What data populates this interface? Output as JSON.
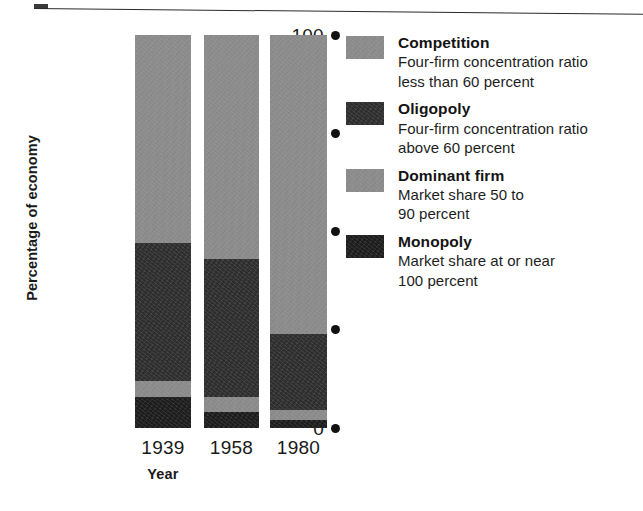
{
  "chart_data": {
    "type": "bar",
    "subtype": "stacked-bar-100",
    "title": "",
    "xlabel": "Year",
    "ylabel": "Percentage of economy",
    "categories": [
      "1939",
      "1958",
      "1980"
    ],
    "ylim": [
      0,
      100
    ],
    "yticks": [
      "0",
      "25",
      "50",
      "75",
      "100"
    ],
    "ytick_values": [
      0,
      25,
      50,
      75,
      100
    ],
    "grid": false,
    "legend_position": "right",
    "stack_order_bottom_to_top": [
      "Monopoly",
      "Dominant firm",
      "Oligopoly",
      "Competition"
    ],
    "series": [
      {
        "name": "Competition",
        "color": "#8c8c8c",
        "values": [
          53,
          57,
          76
        ]
      },
      {
        "name": "Oligopoly",
        "color": "#2d2d2d",
        "values": [
          35,
          35,
          19.5
        ]
      },
      {
        "name": "Dominant firm",
        "color": "#8c8c8c",
        "values": [
          4,
          4,
          2.5
        ]
      },
      {
        "name": "Monopoly",
        "color": "#1c1c1c",
        "values": [
          8,
          4,
          2
        ]
      }
    ],
    "cumulative_tops": {
      "1939": {
        "Monopoly": 8,
        "Dominant firm": 12,
        "Oligopoly": 47,
        "Competition": 100
      },
      "1958": {
        "Monopoly": 4,
        "Dominant firm": 8,
        "Oligopoly": 43,
        "Competition": 100
      },
      "1980": {
        "Monopoly": 2,
        "Dominant firm": 4.5,
        "Oligopoly": 24,
        "Competition": 100
      }
    }
  },
  "axes": {
    "y_title": "Percentage of economy",
    "x_title": "Year",
    "y_ticks": [
      {
        "label": "100",
        "value": 100
      },
      {
        "label": "75",
        "value": 75
      },
      {
        "label": "50",
        "value": 50
      },
      {
        "label": "25",
        "value": 25
      },
      {
        "label": "0",
        "value": 0
      }
    ],
    "x_ticks": [
      {
        "label": "1939"
      },
      {
        "label": "1958"
      },
      {
        "label": "1980"
      }
    ]
  },
  "legend": {
    "entries": [
      {
        "key": "competition",
        "title": "Competition",
        "desc": "Four-firm concentration ratio\nless than 60 percent",
        "color": "#8c8c8c"
      },
      {
        "key": "oligopoly",
        "title": "Oligopoly",
        "desc": "Four-firm concentration ratio\nabove 60 percent",
        "color": "#2d2d2d"
      },
      {
        "key": "dominant",
        "title": "Dominant firm",
        "desc": "Market share 50 to\n90 percent",
        "color": "#8c8c8c"
      },
      {
        "key": "monopoly",
        "title": "Monopoly",
        "desc": "Market share at or near\n100 percent",
        "color": "#1c1c1c"
      }
    ]
  },
  "colors": {
    "light_gray": "#8c8c8c",
    "dark_gray": "#2d2d2d",
    "black": "#1c1c1c",
    "text": "#1a1a1a",
    "background": "#ffffff"
  }
}
